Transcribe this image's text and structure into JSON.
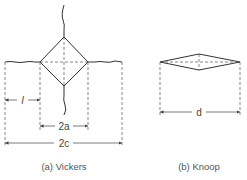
{
  "figure": {
    "panels": [
      {
        "id": "vickers",
        "caption": "(a) Vickers",
        "labels": {
          "l": "l",
          "two_a": "2a",
          "two_c": "2c"
        }
      },
      {
        "id": "knoop",
        "caption": "(b) Knoop",
        "labels": {
          "d": "d"
        }
      }
    ],
    "colors": {
      "line": "#333333",
      "text": "#444444",
      "background": "#ffffff"
    }
  }
}
